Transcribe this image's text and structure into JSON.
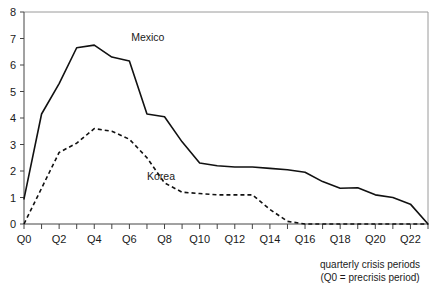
{
  "chart_data": {
    "type": "line",
    "title": "",
    "subtitle": "",
    "xlabel": "quarterly crisis periods",
    "xlabel_note": "(Q0 = precrisis period)",
    "ylabel": "",
    "xlim": [
      0,
      23
    ],
    "ylim": [
      0,
      8
    ],
    "ytick_values": [
      0,
      1,
      2,
      3,
      4,
      5,
      6,
      7,
      8
    ],
    "ytick_labels": [
      "0",
      "1",
      "2",
      "3",
      "4",
      "5",
      "6",
      "7",
      "8"
    ],
    "xtick_values": [
      0,
      1,
      2,
      3,
      4,
      5,
      6,
      7,
      8,
      9,
      10,
      11,
      12,
      13,
      14,
      15,
      16,
      17,
      18,
      19,
      20,
      21,
      22,
      23
    ],
    "xtick_labels_shown": [
      "Q0",
      "Q2",
      "Q4",
      "Q6",
      "Q8",
      "Q10",
      "Q12",
      "Q14",
      "Q16",
      "Q18",
      "Q20",
      "Q22"
    ],
    "xtick_labeled_values": [
      0,
      2,
      4,
      6,
      8,
      10,
      12,
      14,
      16,
      18,
      20,
      22
    ],
    "grid": false,
    "legend_position": "inline-annotation",
    "x": [
      0,
      1,
      2,
      3,
      4,
      5,
      6,
      7,
      8,
      9,
      10,
      11,
      12,
      13,
      14,
      15,
      16,
      17,
      18,
      19,
      20,
      21,
      22,
      23
    ],
    "series": [
      {
        "name": "Mexico",
        "style": "solid",
        "color": "#111111",
        "label_x": 6.1,
        "label_y": 6.9,
        "values": [
          0.95,
          4.15,
          5.3,
          6.65,
          6.75,
          6.3,
          6.15,
          4.15,
          4.05,
          3.1,
          2.3,
          2.2,
          2.15,
          2.15,
          2.1,
          2.05,
          1.95,
          1.6,
          1.35,
          1.37,
          1.1,
          1.0,
          0.75,
          0.0
        ]
      },
      {
        "name": "Korea",
        "style": "dashed",
        "color": "#111111",
        "label_x": 7.0,
        "label_y": 1.65,
        "values": [
          0.0,
          1.35,
          2.7,
          3.05,
          3.6,
          3.5,
          3.2,
          2.5,
          1.55,
          1.2,
          1.15,
          1.1,
          1.1,
          1.1,
          0.55,
          0.1,
          0.0,
          0.0,
          0.0,
          0.0,
          0.0,
          0.0,
          0.0,
          0.0
        ]
      }
    ]
  }
}
